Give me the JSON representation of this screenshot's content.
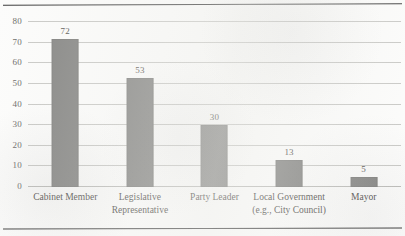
{
  "chart_data": {
    "type": "bar",
    "title": "",
    "subtitle": "",
    "xlabel": "",
    "ylabel": "",
    "ylim": [
      0,
      80
    ],
    "ytick_values": [
      0,
      10,
      20,
      30,
      40,
      50,
      60,
      70,
      80
    ],
    "yticks": [
      "0",
      "10",
      "20",
      "30",
      "40",
      "50",
      "60",
      "70",
      "80"
    ],
    "grid": "horizontal",
    "legend": "none",
    "bar_color": "#858583",
    "categories": [
      "Cabinet Member",
      "Legislative Representative",
      "Party Leader",
      "Local Government (e.g., City Council)",
      "Mayor"
    ],
    "category_lines": [
      [
        "Cabinet Member"
      ],
      [
        "Legislative",
        "Representative"
      ],
      [
        "Party Leader"
      ],
      [
        "Local Government",
        "(e.g., City Council)"
      ],
      [
        "Mayor"
      ]
    ],
    "values": [
      72,
      53,
      30,
      13,
      5
    ],
    "value_labels": [
      "72",
      "53",
      "30",
      "13",
      "5"
    ]
  }
}
